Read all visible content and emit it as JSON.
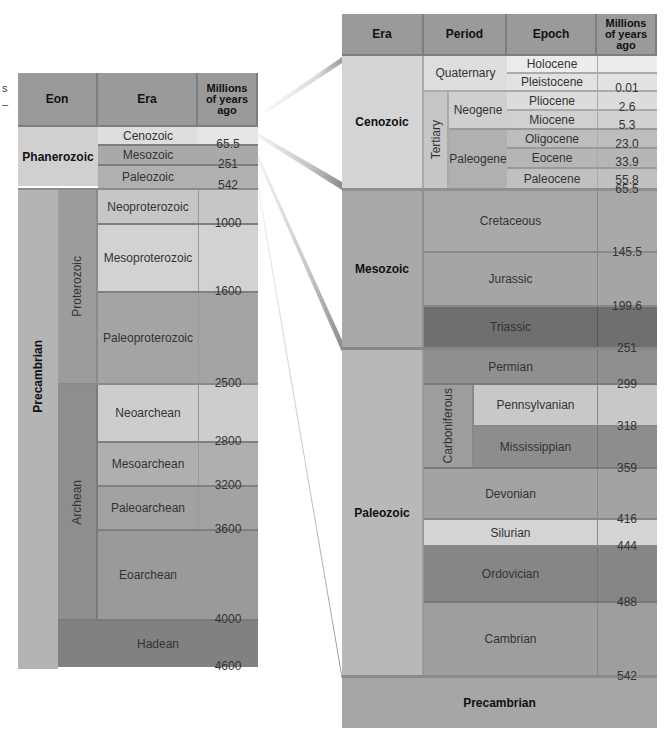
{
  "left_table": {
    "headers": [
      "Eon",
      "Era",
      "Millions of years ago"
    ],
    "phanerozoic": {
      "label": "Phanerozoic",
      "eras": [
        "Cenozoic",
        "Mesozoic",
        "Paleozoic"
      ]
    },
    "precambrian": {
      "label": "Precambrian",
      "proterozoic": {
        "label": "Proterozoic",
        "eras": [
          "Neoproterozoic",
          "Mesoproterozoic",
          "Paleoproterozoic"
        ]
      },
      "archean": {
        "label": "Archean",
        "eras": [
          "Neoarchean",
          "Mesoarchean",
          "Paleoarchean",
          "Eoarchean"
        ]
      },
      "hadean": "Hadean"
    },
    "ages": [
      "65.5",
      "251",
      "542",
      "1000",
      "1600",
      "2500",
      "2800",
      "3200",
      "3600",
      "4000",
      "4600"
    ]
  },
  "right_table": {
    "headers": [
      "Era",
      "Period",
      "Epoch",
      "Millions of years ago"
    ],
    "cenozoic": {
      "label": "Cenozoic",
      "quaternary": "Quaternary",
      "tertiary": "Tertiary",
      "neogene": "Neogene",
      "paleogene": "Paleogene",
      "epochs": [
        "Holocene",
        "Pleistocene",
        "Pliocene",
        "Miocene",
        "Oligocene",
        "Eocene",
        "Paleocene"
      ]
    },
    "mesozoic": {
      "label": "Mesozoic",
      "periods": [
        "Cretaceous",
        "Jurassic",
        "Triassic"
      ]
    },
    "paleozoic": {
      "label": "Paleozoic",
      "periods": [
        "Permian",
        "Carboniferous",
        "Devonian",
        "Silurian",
        "Ordovician",
        "Cambrian"
      ],
      "carboniferous_sub": [
        "Pennsylvanian",
        "Mississippian"
      ]
    },
    "precambrian": "Precambrian",
    "ages": [
      "0.01",
      "2.6",
      "5.3",
      "23.0",
      "33.9",
      "55.8",
      "65.5",
      "145.5",
      "199.6",
      "251",
      "299",
      "318",
      "359",
      "416",
      "444",
      "488",
      "542"
    ]
  },
  "edge_fragments": [
    "s",
    "–"
  ],
  "colors": {
    "header": "#9a9a9a",
    "light": "#dcdcdc",
    "mid": "#b9b9b9",
    "midDark": "#a7a7a7",
    "dark": "#8e8e8e",
    "darkest": "#6e6e6e"
  }
}
